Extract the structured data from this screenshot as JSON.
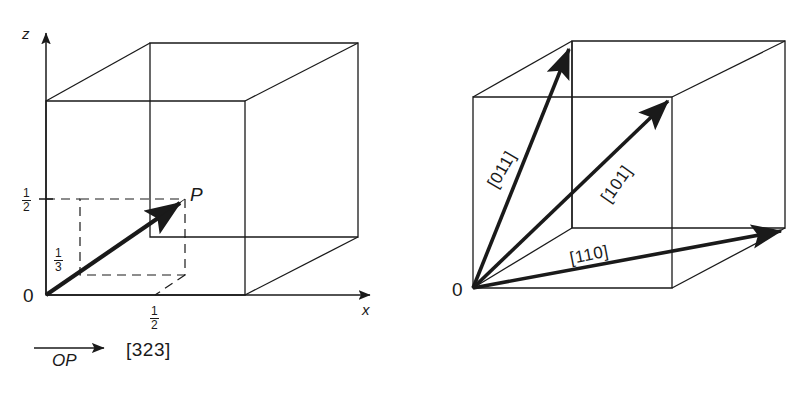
{
  "figure": {
    "type": "crystallographic-direction-diagram",
    "stroke_color": "#1a1a1a",
    "background": "#ffffff",
    "panels": [
      {
        "id": "left",
        "name": "vector-OP-in-unit-cell",
        "axes": [
          {
            "name": "z-axis",
            "label": "z",
            "direction": "up"
          },
          {
            "name": "x-axis",
            "label": "x",
            "direction": "right"
          }
        ],
        "origin_label": "0",
        "point_label": "P",
        "ticks": [
          {
            "axis": "z",
            "numerator": "1",
            "denominator": "2"
          },
          {
            "axis": "origin-side",
            "numerator": "1",
            "denominator": "3"
          },
          {
            "axis": "x",
            "numerator": "1",
            "denominator": "2"
          }
        ],
        "legend": {
          "vector_label": "OP",
          "indices": "[323]"
        }
      },
      {
        "id": "right",
        "name": "three-directions-in-unit-cell",
        "origin_label": "0",
        "directions": [
          {
            "name": "direction-011",
            "label": "[011]",
            "rotation_deg": -60
          },
          {
            "name": "direction-101",
            "label": "[101]",
            "rotation_deg": -55
          },
          {
            "name": "direction-110",
            "label": "[110]",
            "rotation_deg": -11
          }
        ]
      }
    ]
  }
}
